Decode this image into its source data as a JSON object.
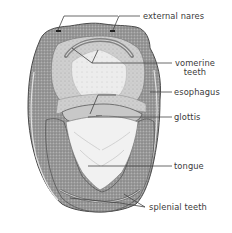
{
  "figure": {
    "labels": {
      "external_nares": "external nares",
      "vomerine_line1": "vomerine",
      "vomerine_line2": "teeth",
      "esophagus": "esophagus",
      "glottis": "glottis",
      "tongue": "tongue",
      "splenial_teeth": "splenial teeth"
    },
    "colors": {
      "ink": "#3a3a3a",
      "shade_dark": "#7d7d7d",
      "shade_mid": "#a8a8a8",
      "shade_light": "#d6d6d6",
      "paper": "#ffffff"
    }
  }
}
